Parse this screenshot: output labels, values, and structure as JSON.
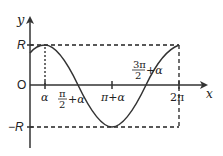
{
  "diagram": {
    "axes": {
      "x_label": "x",
      "y_label": "y",
      "origin_label": "O"
    },
    "y_ticks": {
      "top": "R",
      "bottom": "−R"
    },
    "x_ticks": [
      {
        "id": "alpha",
        "label": "α"
      },
      {
        "id": "half_pi_alpha",
        "num": "π",
        "den": "2",
        "suffix": "+α"
      },
      {
        "id": "pi_alpha",
        "label": "π+α"
      },
      {
        "id": "three_half_pi_alpha",
        "num": "3π",
        "den": "2",
        "suffix": "+α"
      },
      {
        "id": "two_pi",
        "label": "2π"
      }
    ],
    "colors": {
      "axis": "#333333",
      "curve": "#333333",
      "dashed": "#222222"
    }
  }
}
